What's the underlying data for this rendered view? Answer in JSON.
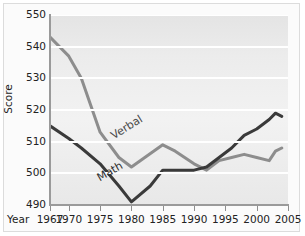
{
  "chart_data": {
    "type": "line",
    "title": "",
    "xlabel": "Year",
    "ylabel": "Score",
    "xlim": [
      1967,
      2005
    ],
    "ylim": [
      490,
      550
    ],
    "grid": true,
    "legend_position": "inline-labels",
    "x_ticks": [
      1967,
      1970,
      1975,
      1980,
      1985,
      1990,
      1995,
      2000,
      2005
    ],
    "x_tick_labels": [
      "1967",
      "1970",
      "1975",
      "1980",
      "1985",
      "1990",
      "1995",
      "2000",
      "2005"
    ],
    "y_ticks": [
      490,
      500,
      510,
      520,
      530,
      540,
      550
    ],
    "y_tick_labels": [
      "490",
      "500",
      "510",
      "520",
      "530",
      "540",
      "550"
    ],
    "series": [
      {
        "name": "Verbal",
        "color": "#8d8d8d",
        "x": [
          1967,
          1970,
          1972,
          1975,
          1978,
          1980,
          1985,
          1987,
          1990,
          1992,
          1994,
          1996,
          1998,
          2000,
          2002,
          2003,
          2004
        ],
        "values": [
          543,
          537,
          530,
          513,
          505,
          502,
          509,
          507,
          503,
          501,
          504,
          505,
          506,
          505,
          504,
          507,
          508
        ]
      },
      {
        "name": "Math",
        "color": "#3a3a3a",
        "x": [
          1967,
          1970,
          1972,
          1975,
          1978,
          1980,
          1983,
          1985,
          1988,
          1990,
          1992,
          1994,
          1996,
          1998,
          2000,
          2002,
          2003,
          2004
        ],
        "values": [
          515,
          511,
          508,
          503,
          496,
          491,
          496,
          501,
          501,
          501,
          502,
          505,
          508,
          512,
          514,
          517,
          519,
          518
        ]
      }
    ]
  },
  "axes": {
    "y_axis_title": "Score",
    "x_axis_title": "Year"
  },
  "annotations": {
    "verbal_label": "Verbal",
    "math_label": "Math"
  },
  "colors": {
    "verbal_line": "#8d8d8d",
    "math_line": "#3a3a3a",
    "plot_background": "#ececec",
    "gridline": "#ffffff",
    "axis": "#9a9a9a"
  }
}
